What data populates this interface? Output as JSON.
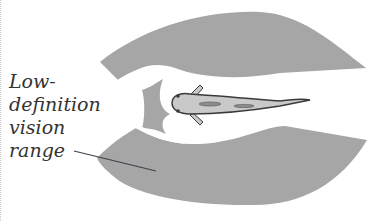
{
  "figure": {
    "label_lines": [
      "Low-",
      "definition",
      "vision",
      "range"
    ],
    "label_full": "Low-definition vision range"
  },
  "colors": {
    "vision_range_fill": "#a6a6a6",
    "fish_body": "#c9c9c9",
    "fish_outline": "#3a3a3a",
    "label_text": "#333333",
    "leader_line": "#3d3f4a",
    "background": "#ffffff"
  },
  "elements": {
    "upper_sector": "low-definition vision range (upper lobe)",
    "lower_sector": "low-definition vision range (lower lobe)",
    "front_sector": "frontal vision region",
    "fish": "fish viewed from above"
  }
}
